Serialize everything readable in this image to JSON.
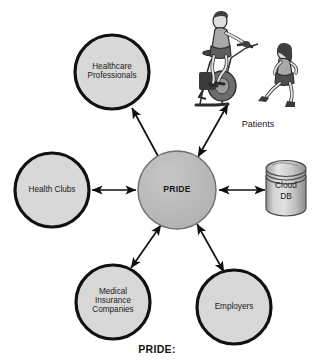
{
  "diagram": {
    "type": "hub-and-spoke",
    "hub": {
      "id": "pride",
      "label": "PRIDE",
      "shape": "circle",
      "cx": 177,
      "cy": 190,
      "r": 39,
      "fill": "#b9b9b9",
      "stroke": "#6f6f6f"
    },
    "nodes": [
      {
        "id": "healthcare-professionals",
        "label": "Healthcare\nProfessionals",
        "shape": "circle",
        "cx": 112,
        "cy": 72,
        "r": 37,
        "fill": "#d8d8d8",
        "stroke": "#111111"
      },
      {
        "id": "health-clubs",
        "label": "Health Clubs",
        "shape": "circle",
        "cx": 52,
        "cy": 190,
        "r": 37,
        "fill": "#d8d8d8",
        "stroke": "#111111"
      },
      {
        "id": "medical-insurance-companies",
        "label": "Medical\nInsurance\nCompanies",
        "shape": "circle",
        "cx": 113,
        "cy": 302,
        "r": 37,
        "fill": "#d8d8d8",
        "stroke": "#111111"
      },
      {
        "id": "employers",
        "label": "Employers",
        "shape": "circle",
        "cx": 234,
        "cy": 307,
        "r": 37,
        "fill": "#d8d8d8",
        "stroke": "#111111"
      },
      {
        "id": "cloud-db",
        "label": "Cloud\nDB",
        "shape": "cylinder",
        "cx": 286,
        "cy": 192,
        "fill": "#c6c6c6",
        "stroke": "#4a4a4a"
      },
      {
        "id": "patients",
        "label": "Patients",
        "shape": "illustration",
        "cx": 258,
        "cy": 126
      }
    ],
    "connectors": [
      {
        "id": "pride-to-healthcare-professionals",
        "from": "pride",
        "to": "healthcare-professionals",
        "arrowheads": "single"
      },
      {
        "id": "pride-to-patients",
        "from": "pride",
        "to": "patients",
        "arrowheads": "double"
      },
      {
        "id": "pride-to-health-clubs",
        "from": "pride",
        "to": "health-clubs",
        "arrowheads": "double"
      },
      {
        "id": "pride-to-cloud-db",
        "from": "pride",
        "to": "cloud-db",
        "arrowheads": "double"
      },
      {
        "id": "pride-to-medical-insurance-companies",
        "from": "pride",
        "to": "medical-insurance-companies",
        "arrowheads": "double"
      },
      {
        "id": "pride-to-employers",
        "from": "pride",
        "to": "employers",
        "arrowheads": "double"
      }
    ]
  },
  "caption": {
    "text": "PRIDE:"
  },
  "labels": {
    "healthcare_professionals": "Healthcare\nProfessionals",
    "health_clubs": "Health Clubs",
    "medical_insurance_companies": "Medical\nInsurance\nCompanies",
    "employers": "Employers",
    "pride": "PRIDE",
    "cloud_db": "Cloud\nDB",
    "patients": "Patients"
  },
  "colors": {
    "node_fill": "#d8d8d8",
    "hub_fill": "#b9b9b9",
    "node_stroke": "#111111",
    "connector": "#101010",
    "text": "#1b1b1b",
    "background": "#ffffff"
  }
}
